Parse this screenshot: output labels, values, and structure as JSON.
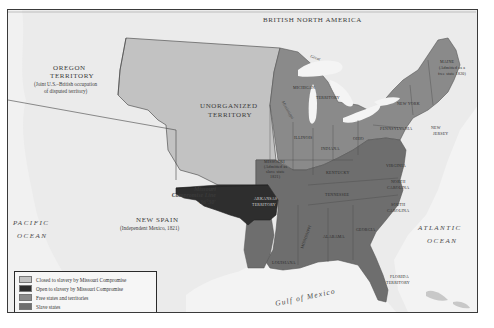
{
  "map": {
    "colors": {
      "background": "#ebebeb",
      "closed_to_slavery": "#c2c2c2",
      "open_to_slavery": "#2e2e2e",
      "free_states": "#8a8a8a",
      "slave_states": "#6e6e6e",
      "water": "#f4f4f4",
      "frame": "#3a3a3a"
    },
    "regions": {
      "british_north_america": "BRITISH NORTH AMERICA",
      "oregon_title_1": "OREGON",
      "oregon_title_2": "TERRITORY",
      "oregon_sub_1": "(Joint U.S.–British occupation",
      "oregon_sub_2": "of disputed territory)",
      "unorganized_1": "UNORGANIZED",
      "unorganized_2": "TERRITORY",
      "new_spain": "NEW SPAIN",
      "new_spain_sub": "(Independent Mexico, 1821)"
    },
    "missouri_compromise_line": {
      "line1": "Missouri",
      "line2": "Compromise Line",
      "line3": "36°30′"
    },
    "oceans": {
      "pacific_1": "PACIFIC",
      "pacific_2": "OCEAN",
      "atlantic_1": "ATLANTIC",
      "atlantic_2": "OCEAN",
      "gulf": "Gulf of Mexico"
    },
    "lakes": {
      "superior": "Great",
      "michigan_river": "Mississippi"
    },
    "states": {
      "maine_1": "MAINE",
      "maine_2": "(Admitted as a",
      "maine_3": "free state 1820)",
      "new_york": "NEW YORK",
      "pennsylvania": "PENNSYLVANIA",
      "new_jersey_1": "NEW",
      "new_jersey_2": "JERSEY",
      "michigan_1": "MICHIGAN",
      "michigan_2": "TERRITORY",
      "illinois": "ILLINOIS",
      "indiana": "INDIANA",
      "ohio": "OHIO",
      "missouri_1": "MISSOURI",
      "missouri_2": "(Admitted as",
      "missouri_3": "slave state",
      "missouri_4": "1821)",
      "kentucky": "KENTUCKY",
      "virginia": "VIRGINIA",
      "north_carolina_1": "NORTH",
      "north_carolina_2": "CAROLINA",
      "tennessee": "TENNESSEE",
      "south_carolina_1": "SOUTH",
      "south_carolina_2": "CAROLINA",
      "arkansas_1": "ARKANSAS",
      "arkansas_2": "TERRITORY",
      "mississippi": "MISSISSIPPI",
      "alabama": "ALABAMA",
      "georgia": "GEORGIA",
      "louisiana": "LOUISIANA",
      "florida_1": "FLORIDA",
      "florida_2": "TERRITORY"
    },
    "legend": [
      {
        "label": "Closed to slavery by Missouri Compromise",
        "color": "#c2c2c2"
      },
      {
        "label": "Open to slavery by Missouri Compromise",
        "color": "#2e2e2e"
      },
      {
        "label": "Free states and territories",
        "color": "#8a8a8a"
      },
      {
        "label": "Slave states",
        "color": "#6e6e6e"
      }
    ]
  }
}
